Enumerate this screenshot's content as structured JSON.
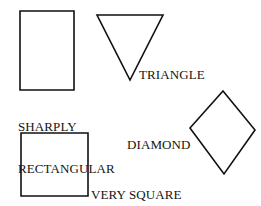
{
  "figure": {
    "background_color": "#ffffff",
    "stroke_color": "#111111",
    "text_color": "#141414",
    "width": 261,
    "height": 206
  },
  "shapes": [
    {
      "id": "rectangle",
      "name": "tall-rectangle",
      "kind": "rectangle",
      "points": "20,11 74,11 74,90 20,90",
      "label": "SHARPLY RECTANGULAR"
    },
    {
      "id": "triangle",
      "name": "inverted-triangle",
      "kind": "triangle",
      "points": "97,15 163,15 130,80",
      "label": "TRIANGLE"
    },
    {
      "id": "square",
      "name": "square",
      "kind": "square",
      "points": "21,133 88,133 88,196 21,196",
      "label": "VERY SQUARE"
    },
    {
      "id": "diamond",
      "name": "diamond",
      "kind": "diamond",
      "points": "223,91 255,130 224,174 190,128",
      "label": "DIAMOND"
    }
  ],
  "labels": {
    "sharply_line1": "SHARPLY",
    "sharply_line2": "RECTANGULAR",
    "triangle": "TRIANGLE",
    "diamond": "DIAMOND",
    "very_square": "VERY SQUARE"
  }
}
